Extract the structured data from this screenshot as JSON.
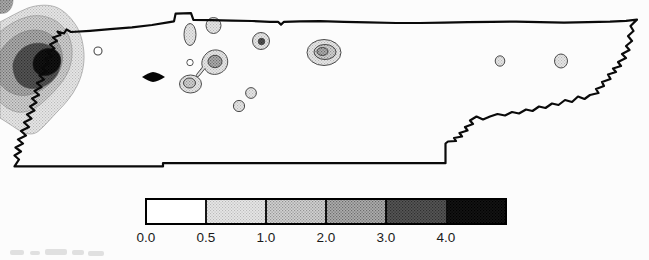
{
  "figure": {
    "background": "#fcfcfc"
  },
  "map": {
    "outline_color": "#0a0a0a",
    "marker": {
      "shape": "filled-lens-marker",
      "color": "#050505"
    },
    "contour_levels": [
      "0.0-0.5",
      "0.5-1.0",
      "1.0-2.0",
      "2.0-3.0",
      "3.0-4.0",
      "4.0+"
    ]
  },
  "legend": {
    "ticks": [
      "0.0",
      "0.5",
      "1.0",
      "2.0",
      "3.0",
      "4.0"
    ],
    "frame_color": "#000000",
    "label_color": "#1a1a1a",
    "level_fills": [
      "#ffffff",
      "#e2e2e2",
      "#cccccc",
      "#a8a8a8",
      "#4f4f4f",
      "#111111"
    ]
  }
}
